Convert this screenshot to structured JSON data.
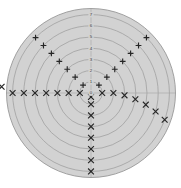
{
  "chart_data": {
    "type": "scatter",
    "projection": "polar",
    "title": "",
    "xlabel": "",
    "ylabel": "",
    "background_color": "#d2d2d2",
    "grid": true,
    "grid_color": "#9a9a9a",
    "legend": null,
    "radial_axis": {
      "angle_deg": 90,
      "tick_labels": [
        "0",
        "1",
        "2",
        "3",
        "4",
        "5",
        "6",
        "7"
      ],
      "tick_radii": [
        0,
        1,
        2,
        3,
        4,
        5,
        6,
        7
      ],
      "rlim": [
        0,
        7.6
      ]
    },
    "angular_axis": {
      "visible_spokes_deg": [
        0,
        180
      ],
      "direction": "counterclockwise",
      "offset_deg": 0
    },
    "series": [
      {
        "name": "plus-series",
        "marker": "+",
        "color": "#262626",
        "points_polar": [
          {
            "theta_deg": 135,
            "r": 1.0
          },
          {
            "theta_deg": 135,
            "r": 2.0
          },
          {
            "theta_deg": 135,
            "r": 3.0
          },
          {
            "theta_deg": 135,
            "r": 4.0
          },
          {
            "theta_deg": 135,
            "r": 5.0
          },
          {
            "theta_deg": 135,
            "r": 6.0
          },
          {
            "theta_deg": 135,
            "r": 7.0
          },
          {
            "theta_deg": 45,
            "r": 1.0
          },
          {
            "theta_deg": 45,
            "r": 2.0
          },
          {
            "theta_deg": 45,
            "r": 3.0
          },
          {
            "theta_deg": 45,
            "r": 4.0
          },
          {
            "theta_deg": 45,
            "r": 5.0
          },
          {
            "theta_deg": 45,
            "r": 6.0
          },
          {
            "theta_deg": 45,
            "r": 7.0
          }
        ]
      },
      {
        "name": "cross-series",
        "marker": "x",
        "color": "#262626",
        "points_polar": [
          {
            "theta_deg": 180,
            "r": 1.0
          },
          {
            "theta_deg": 180,
            "r": 2.0
          },
          {
            "theta_deg": 180,
            "r": 3.0
          },
          {
            "theta_deg": 180,
            "r": 4.0
          },
          {
            "theta_deg": 180,
            "r": 5.0
          },
          {
            "theta_deg": 180,
            "r": 6.0
          },
          {
            "theta_deg": 180,
            "r": 7.0
          },
          {
            "theta_deg": 176,
            "r": 8.0
          },
          {
            "theta_deg": 0,
            "r": 1.0
          },
          {
            "theta_deg": 0,
            "r": 2.0
          },
          {
            "theta_deg": 356,
            "r": 3.0
          },
          {
            "theta_deg": 352,
            "r": 4.0
          },
          {
            "theta_deg": 348,
            "r": 5.0
          },
          {
            "theta_deg": 344,
            "r": 6.0
          },
          {
            "theta_deg": 340,
            "r": 7.0
          },
          {
            "theta_deg": 270,
            "r": 1.0
          },
          {
            "theta_deg": 270,
            "r": 2.0
          },
          {
            "theta_deg": 270,
            "r": 3.0
          },
          {
            "theta_deg": 270,
            "r": 4.0
          },
          {
            "theta_deg": 270,
            "r": 5.0
          },
          {
            "theta_deg": 270,
            "r": 6.0
          },
          {
            "theta_deg": 270,
            "r": 7.0
          },
          {
            "theta_deg": 270,
            "r": 0.35
          }
        ]
      }
    ]
  },
  "figure": {
    "width_px": 181,
    "height_px": 188,
    "center_x_px": 91,
    "center_y_px": 93,
    "outer_radius_px": 85,
    "ring_step_px": 11.2
  }
}
